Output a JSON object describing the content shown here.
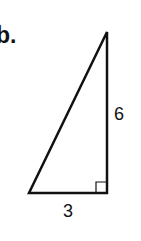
{
  "problem_label": "b.",
  "figure": {
    "type": "right-triangle",
    "vertices": {
      "top": [
        107,
        32
      ],
      "bottom_left": [
        29,
        193
      ],
      "right_angle": [
        107,
        193
      ]
    },
    "sides": {
      "vertical": "6",
      "horizontal": "3"
    },
    "right_angle_marker": true,
    "stroke_color": "#111111"
  }
}
